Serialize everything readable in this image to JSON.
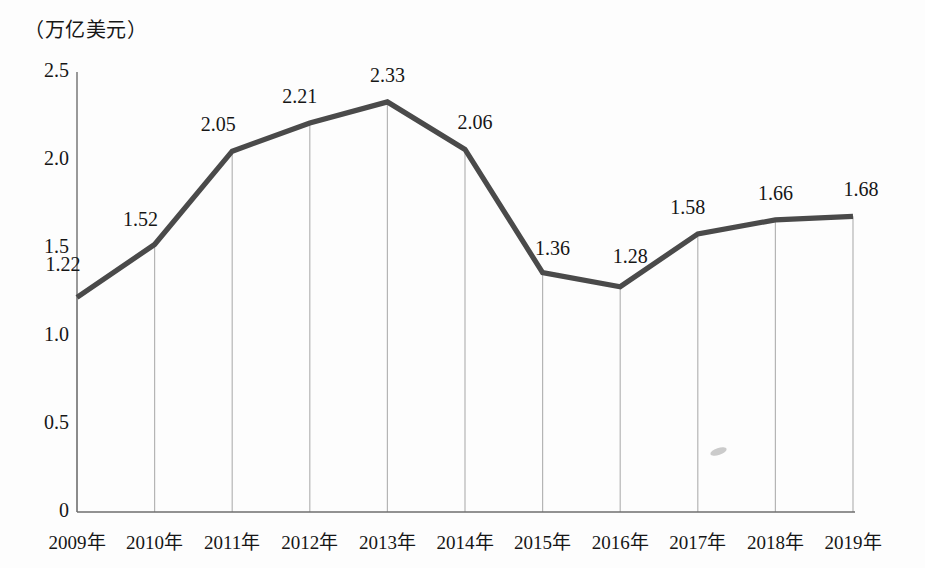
{
  "chart_data": {
    "type": "line",
    "title": "",
    "subtitle": "",
    "xlabel": "",
    "ylabel": "（万亿美元）",
    "ylim": [
      0,
      2.5
    ],
    "yticks": [
      "0",
      "0.5",
      "1.0",
      "1.5",
      "2.0",
      "2.5"
    ],
    "ytick_values": [
      0,
      0.5,
      1.0,
      1.5,
      2.0,
      2.5
    ],
    "grid": false,
    "legend": null,
    "legend_position": "none",
    "drop_lines": true,
    "categories": [
      "2009年",
      "2010年",
      "2011年",
      "2012年",
      "2013年",
      "2014年",
      "2015年",
      "2016年",
      "2017年",
      "2018年",
      "2019年"
    ],
    "values": [
      1.22,
      1.52,
      2.05,
      2.21,
      2.33,
      2.06,
      1.36,
      1.28,
      1.58,
      1.66,
      1.68
    ],
    "data_labels": [
      "1.22",
      "1.52",
      "2.05",
      "2.21",
      "2.33",
      "2.06",
      "1.36",
      "1.28",
      "1.58",
      "1.66",
      "1.68"
    ],
    "series": [
      {
        "name": "",
        "values": [
          1.22,
          1.52,
          2.05,
          2.21,
          2.33,
          2.06,
          1.36,
          1.28,
          1.58,
          1.66,
          1.68
        ]
      }
    ]
  },
  "colors": {
    "line": "#4a4a4a",
    "axis": "#6e6e6e",
    "drop_line": "#b5b5b5",
    "text": "#161616",
    "background": "#fdfdfd"
  }
}
